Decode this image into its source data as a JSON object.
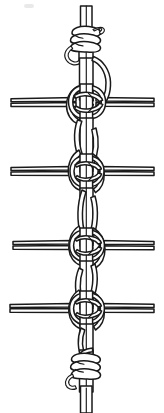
{
  "figure": {
    "title": "Ratline lashing on a vertical rope",
    "caption": "",
    "medium": "pen-and-ink line drawing",
    "background_color": "#ffffff",
    "ink_color": "#1a1a1a",
    "canvas": {
      "width": 164,
      "height": 413
    }
  },
  "geometry": {
    "vertical_rope": {
      "label": "vertical standing rope",
      "center_x": 86,
      "outer_left_x": 79,
      "outer_right_x": 93,
      "top_y": 6,
      "bottom_y": 413,
      "strand_count": 2
    },
    "rungs": [
      {
        "name": "rung-1",
        "y_top": 98,
        "y_bottom": 107,
        "x_left": 10,
        "x_right": 155
      },
      {
        "name": "rung-2",
        "y_top": 167,
        "y_bottom": 176,
        "x_left": 10,
        "x_right": 155
      },
      {
        "name": "rung-3",
        "y_top": 241,
        "y_bottom": 250,
        "x_left": 10,
        "x_right": 155
      },
      {
        "name": "rung-4",
        "y_top": 304,
        "y_bottom": 313,
        "x_left": 10,
        "x_right": 155
      }
    ],
    "knots": [
      {
        "name": "top-whipping",
        "center_y": 42,
        "kind": "whipping-seizing"
      },
      {
        "name": "hitch-1",
        "center_y": 102,
        "kind": "marline-hitch"
      },
      {
        "name": "hitch-2",
        "center_y": 171,
        "kind": "marline-hitch"
      },
      {
        "name": "hitch-3",
        "center_y": 245,
        "kind": "marline-hitch"
      },
      {
        "name": "hitch-4",
        "center_y": 308,
        "kind": "marline-hitch"
      },
      {
        "name": "bottom-whipping",
        "center_y": 368,
        "kind": "whipping-seizing"
      }
    ]
  },
  "colors": {
    "ink": "#1a1a1a",
    "ink_soft": "#3c3c3c",
    "paper": "#ffffff",
    "smudge": "#d8d8d8"
  }
}
